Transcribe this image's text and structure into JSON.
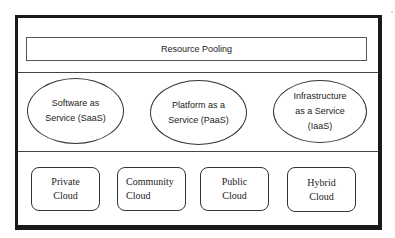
{
  "diagram": {
    "top_layer": {
      "label": "Resource Pooling"
    },
    "service_models": [
      {
        "label": "Software as\nService (SaaS)"
      },
      {
        "label": "Platform as a\nService (PaaS)"
      },
      {
        "label": "Infrastructure\nas a Service\n(IaaS)"
      }
    ],
    "deployment_models": [
      {
        "label": "Private\nCloud"
      },
      {
        "label": "Community\nCloud"
      },
      {
        "label": "Public\nCloud"
      },
      {
        "label": "Hybrid\nCloud"
      }
    ]
  }
}
